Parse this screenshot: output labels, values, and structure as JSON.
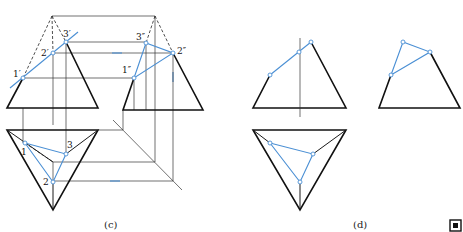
{
  "figure": {
    "panels": [
      {
        "caption": "(c)",
        "views": {
          "front": {
            "labels": {
              "p1": "1′",
              "p2": "2′",
              "p3": "3′"
            }
          },
          "side": {
            "labels": {
              "p1": "1″",
              "p2": "2″",
              "p3": "3″"
            }
          },
          "top": {
            "labels": {
              "p1": "1",
              "p2": "2",
              "p3": "3"
            }
          }
        }
      },
      {
        "caption": "(d)"
      }
    ],
    "colors": {
      "outline": "#111111",
      "construction": "#333333",
      "section": "#4a8fd4"
    },
    "corner_icon": "qr-code-icon"
  }
}
